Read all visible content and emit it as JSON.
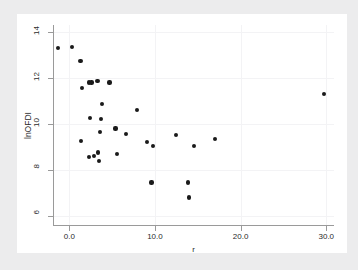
{
  "chart_data": {
    "type": "scatter",
    "title": "",
    "xlabel": "r",
    "ylabel": "lnOFDI",
    "xlim": [
      -1.9,
      30.9
    ],
    "ylim": [
      5.6,
      14.3
    ],
    "xticks": [
      0.0,
      10.0,
      20.0,
      30.0
    ],
    "xtick_labels": [
      "0.0",
      "10.0",
      "20.0",
      "30.0"
    ],
    "yticks": [
      6,
      8,
      10,
      12,
      14
    ],
    "ytick_labels": [
      "6",
      "8",
      "10",
      "12",
      "14"
    ],
    "grid": "faint-vertical-and-horizontal",
    "legend": "none",
    "marker": "filled-circle",
    "marker_color": "#1a1a1a",
    "points": [
      {
        "x": -1.3,
        "y": 13.3
      },
      {
        "x": 0.3,
        "y": 13.35
      },
      {
        "x": 1.3,
        "y": 12.75
      },
      {
        "x": 1.5,
        "y": 11.55
      },
      {
        "x": 2.3,
        "y": 11.8
      },
      {
        "x": 2.6,
        "y": 11.8
      },
      {
        "x": 3.3,
        "y": 11.85
      },
      {
        "x": 4.7,
        "y": 11.8
      },
      {
        "x": 3.8,
        "y": 10.85
      },
      {
        "x": 2.4,
        "y": 10.25
      },
      {
        "x": 3.7,
        "y": 10.2
      },
      {
        "x": 7.9,
        "y": 10.6
      },
      {
        "x": 5.4,
        "y": 9.8
      },
      {
        "x": 3.6,
        "y": 9.65
      },
      {
        "x": 6.6,
        "y": 9.55
      },
      {
        "x": 12.5,
        "y": 9.5
      },
      {
        "x": 17.0,
        "y": 9.35
      },
      {
        "x": 1.4,
        "y": 9.25
      },
      {
        "x": 9.1,
        "y": 9.2
      },
      {
        "x": 9.8,
        "y": 9.05
      },
      {
        "x": 14.6,
        "y": 9.05
      },
      {
        "x": 29.7,
        "y": 11.3
      },
      {
        "x": 3.4,
        "y": 8.75
      },
      {
        "x": 5.6,
        "y": 8.7
      },
      {
        "x": 2.9,
        "y": 8.6
      },
      {
        "x": 2.3,
        "y": 8.55
      },
      {
        "x": 3.5,
        "y": 8.4
      },
      {
        "x": 9.6,
        "y": 7.45
      },
      {
        "x": 13.9,
        "y": 7.45
      },
      {
        "x": 14.0,
        "y": 6.8
      }
    ]
  }
}
